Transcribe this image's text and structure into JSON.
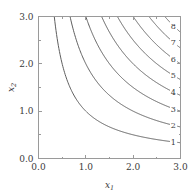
{
  "chart_data": {
    "type": "line",
    "title": "",
    "subtitle": "",
    "xlabel": "x_1",
    "ylabel": "x_2",
    "xlabel_base": "x",
    "xlabel_sub": "1",
    "ylabel_base": "x",
    "ylabel_sub": "2",
    "xlim": [
      0.0,
      3.0
    ],
    "ylim": [
      0.0,
      3.0
    ],
    "xticks": [
      0.0,
      1.0,
      2.0,
      3.0
    ],
    "yticks": [
      0.0,
      1.0,
      2.0,
      3.0
    ],
    "xtick_labels": [
      "0.0",
      "1.0",
      "2.0",
      "3.0"
    ],
    "ytick_labels": [
      "0.0",
      "1.0",
      "2.0",
      "3.0"
    ],
    "xminor_ticks": [
      0.5,
      1.5,
      2.5
    ],
    "yminor_ticks": [
      0.5,
      1.5,
      2.5
    ],
    "grid": false,
    "legend": "none",
    "contour_levels": [
      1,
      2,
      3,
      4,
      5,
      6,
      7,
      8
    ],
    "level_labels": [
      "1",
      "2",
      "3",
      "4",
      "5",
      "6",
      "7",
      "8"
    ],
    "curve_color": "#5e5e5e",
    "axis_color": "#9a9a9a",
    "text_color": "#3a3a3a",
    "background_color": "#ffffff",
    "series": [
      {
        "name": "1",
        "level": 1,
        "label": "1",
        "points": [
          [
            0.3333,
            3.0
          ],
          [
            0.4,
            2.5
          ],
          [
            0.5,
            2.0
          ],
          [
            0.6667,
            1.5
          ],
          [
            0.8,
            1.25
          ],
          [
            1.0,
            1.0
          ],
          [
            1.25,
            0.8
          ],
          [
            1.5,
            0.6667
          ],
          [
            2.0,
            0.5
          ],
          [
            2.5,
            0.4
          ],
          [
            3.0,
            0.3333
          ]
        ],
        "label_point": [
          2.85,
          0.351
        ]
      },
      {
        "name": "2",
        "level": 2,
        "label": "2",
        "points": [
          [
            0.6667,
            3.0
          ],
          [
            0.8,
            2.5
          ],
          [
            1.0,
            2.0
          ],
          [
            1.3333,
            1.5
          ],
          [
            1.6,
            1.25
          ],
          [
            2.0,
            1.0
          ],
          [
            2.5,
            0.8
          ],
          [
            3.0,
            0.6667
          ]
        ],
        "label_point": [
          2.85,
          0.702
        ]
      },
      {
        "name": "3",
        "level": 3,
        "label": "3",
        "points": [
          [
            1.0,
            3.0
          ],
          [
            1.2,
            2.5
          ],
          [
            1.5,
            2.0
          ],
          [
            2.0,
            1.5
          ],
          [
            2.4,
            1.25
          ],
          [
            3.0,
            1.0
          ]
        ],
        "label_point": [
          2.85,
          1.053
        ]
      },
      {
        "name": "4",
        "level": 4,
        "label": "4",
        "points": [
          [
            1.3333,
            3.0
          ],
          [
            1.6,
            2.5
          ],
          [
            2.0,
            2.0
          ],
          [
            2.6667,
            1.5
          ],
          [
            3.0,
            1.3333
          ]
        ],
        "label_point": [
          2.85,
          1.404
        ]
      },
      {
        "name": "5",
        "level": 5,
        "label": "5",
        "points": [
          [
            1.6667,
            3.0
          ],
          [
            2.0,
            2.5
          ],
          [
            2.5,
            2.0
          ],
          [
            3.0,
            1.6667
          ]
        ],
        "label_point": [
          2.85,
          1.754
        ]
      },
      {
        "name": "6",
        "level": 6,
        "label": "6",
        "points": [
          [
            2.0,
            3.0
          ],
          [
            2.4,
            2.5
          ],
          [
            3.0,
            2.0
          ]
        ],
        "label_point": [
          2.85,
          2.105
        ]
      },
      {
        "name": "7",
        "level": 7,
        "label": "7",
        "points": [
          [
            2.3333,
            3.0
          ],
          [
            2.8,
            2.5
          ],
          [
            3.0,
            2.3333
          ]
        ],
        "label_point": [
          2.85,
          2.456
        ]
      },
      {
        "name": "8",
        "level": 8,
        "label": "8",
        "points": [
          [
            2.6667,
            3.0
          ],
          [
            3.0,
            2.6667
          ]
        ],
        "label_point": [
          2.85,
          2.807
        ]
      }
    ]
  }
}
